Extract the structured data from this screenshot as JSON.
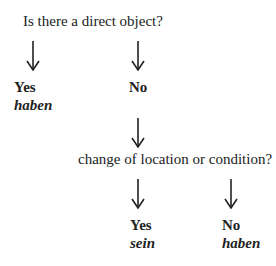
{
  "diagram": {
    "question1": "Is there a direct object?",
    "branch1_yes": {
      "label": "Yes",
      "result": "haben"
    },
    "branch1_no": {
      "label": "No"
    },
    "question2": "change of location or condition?",
    "branch2_yes": {
      "label": "Yes",
      "result": "sein"
    },
    "branch2_no": {
      "label": "No",
      "result": "haben"
    }
  }
}
